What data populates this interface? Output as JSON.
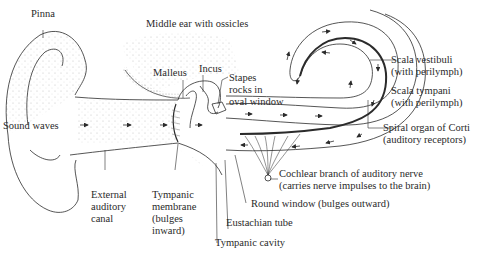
{
  "diagram": {
    "line_color": "#2b2b2b",
    "stipple_color": "#9a9a9a",
    "labels": {
      "pinna": "Pinna",
      "middle_ear": "Middle ear with ossicles",
      "malleus": "Malleus",
      "incus": "Incus",
      "stapes": [
        "Stapes",
        "rocks in",
        "oval window"
      ],
      "sound_waves": "Sound waves",
      "scala_vestibuli": [
        "Scala vestibuli",
        "(with perilymph)"
      ],
      "scala_tympani": [
        "Scala tympani",
        "(with perilymph)"
      ],
      "spiral_organ": [
        "Spiral organ of Corti",
        "(auditory receptors)"
      ],
      "cochlear_nerve": [
        "Cochlear branch of auditory nerve",
        "(carries nerve impulses to the brain)"
      ],
      "round_window": "Round window (bulges outward)",
      "eustachian_tube": "Eustachian tube",
      "tympanic_cavity": "Tympanic cavity",
      "external_canal": [
        "External",
        "auditory",
        "canal"
      ],
      "tympanic_membrane": [
        "Tympanic",
        "membrane",
        "(bulges",
        "inward)"
      ]
    }
  }
}
